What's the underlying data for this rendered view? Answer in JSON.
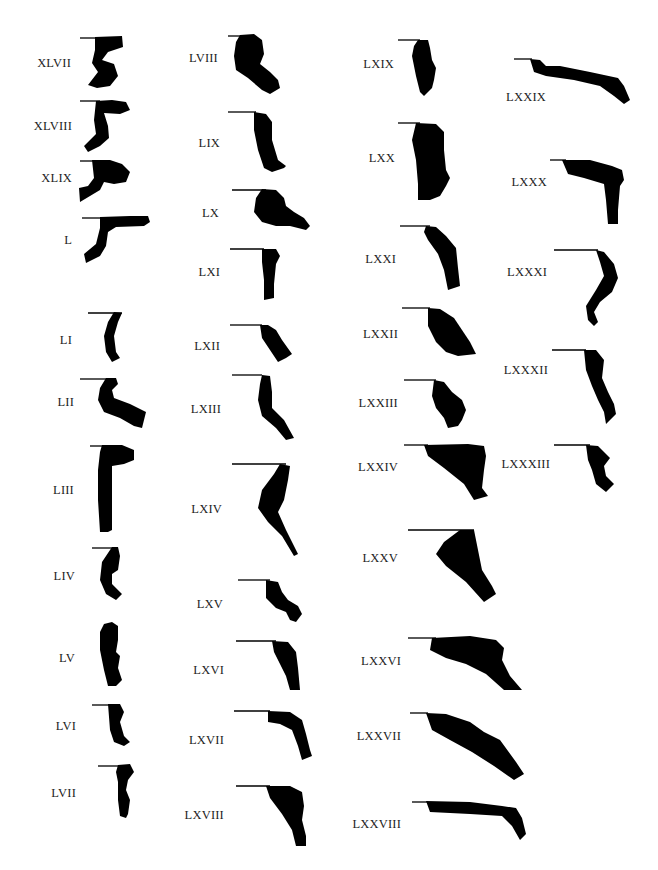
{
  "page": {
    "type": "plate of pottery rim profiles",
    "background": "#ffffff",
    "ink": "#000000"
  },
  "profiles": [
    {
      "id": "XLVII",
      "label": "XLVII",
      "lx": 71,
      "ly": 63
    },
    {
      "id": "XLVIII",
      "label": "XLVIII",
      "lx": 72,
      "ly": 126
    },
    {
      "id": "XLIX",
      "label": "XLIX",
      "lx": 72,
      "ly": 178
    },
    {
      "id": "L",
      "label": "L",
      "lx": 72,
      "ly": 240
    },
    {
      "id": "LI",
      "label": "LI",
      "lx": 72,
      "ly": 340
    },
    {
      "id": "LII",
      "label": "LII",
      "lx": 74,
      "ly": 402
    },
    {
      "id": "LIII",
      "label": "LIII",
      "lx": 74,
      "ly": 490
    },
    {
      "id": "LIV",
      "label": "LIV",
      "lx": 75,
      "ly": 576
    },
    {
      "id": "LV",
      "label": "LV",
      "lx": 75,
      "ly": 658
    },
    {
      "id": "LVI",
      "label": "LVI",
      "lx": 76,
      "ly": 726
    },
    {
      "id": "LVII",
      "label": "LVII",
      "lx": 76,
      "ly": 793
    },
    {
      "id": "LVIII",
      "label": "LVIII",
      "lx": 218,
      "ly": 58
    },
    {
      "id": "LIX",
      "label": "LIX",
      "lx": 220,
      "ly": 143
    },
    {
      "id": "LX",
      "label": "LX",
      "lx": 219,
      "ly": 213
    },
    {
      "id": "LXI",
      "label": "LXI",
      "lx": 220,
      "ly": 272
    },
    {
      "id": "LXII",
      "label": "LXII",
      "lx": 220,
      "ly": 346
    },
    {
      "id": "LXIII",
      "label": "LXIII",
      "lx": 221,
      "ly": 409
    },
    {
      "id": "LXIV",
      "label": "LXIV",
      "lx": 222,
      "ly": 509
    },
    {
      "id": "LXV",
      "label": "LXV",
      "lx": 223,
      "ly": 604
    },
    {
      "id": "LXVI",
      "label": "LXVI",
      "lx": 224,
      "ly": 670
    },
    {
      "id": "LXVII",
      "label": "LXVII",
      "lx": 224,
      "ly": 740
    },
    {
      "id": "LXVIII",
      "label": "LXVIII",
      "lx": 224,
      "ly": 815
    },
    {
      "id": "LXIX",
      "label": "LXIX",
      "lx": 394,
      "ly": 64
    },
    {
      "id": "LXX",
      "label": "LXX",
      "lx": 395,
      "ly": 158
    },
    {
      "id": "LXXI",
      "label": "LXXI",
      "lx": 396,
      "ly": 259
    },
    {
      "id": "LXXII",
      "label": "LXXII",
      "lx": 398,
      "ly": 334
    },
    {
      "id": "LXXIII",
      "label": "LXXIII",
      "lx": 398,
      "ly": 403
    },
    {
      "id": "LXXIV",
      "label": "LXXIV",
      "lx": 398,
      "ly": 467
    },
    {
      "id": "LXXV",
      "label": "LXXV",
      "lx": 398,
      "ly": 558
    },
    {
      "id": "LXXVI",
      "label": "LXXVI",
      "lx": 401,
      "ly": 661
    },
    {
      "id": "LXXVII",
      "label": "LXXVII",
      "lx": 401,
      "ly": 736
    },
    {
      "id": "LXXVIII",
      "label": "LXXVIII",
      "lx": 401,
      "ly": 824
    },
    {
      "id": "LXXIX",
      "label": "LXXIX",
      "lx": 546,
      "ly": 97
    },
    {
      "id": "LXXX",
      "label": "LXXX",
      "lx": 547,
      "ly": 182
    },
    {
      "id": "LXXXI",
      "label": "LXXXI",
      "lx": 547,
      "ly": 272
    },
    {
      "id": "LXXXII",
      "label": "LXXXII",
      "lx": 548,
      "ly": 370
    },
    {
      "id": "LXXXIII",
      "label": "LXXXIII",
      "lx": 550,
      "ly": 464
    }
  ]
}
